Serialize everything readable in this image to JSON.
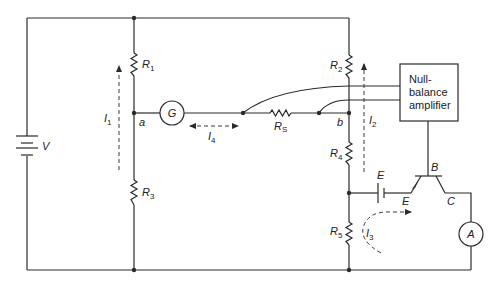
{
  "diagram": {
    "type": "circuit",
    "components": {
      "battery": {
        "label": "V"
      },
      "r1": {
        "label": "R",
        "sub": "1"
      },
      "r2": {
        "label": "R",
        "sub": "2"
      },
      "r3": {
        "label": "R",
        "sub": "3"
      },
      "r4": {
        "label": "R",
        "sub": "4"
      },
      "r5": {
        "label": "R",
        "sub": "5"
      },
      "rs": {
        "label": "R",
        "sub": "S"
      },
      "galvanometer": {
        "label": "G"
      },
      "ammeter": {
        "label": "A"
      },
      "amplifier": {
        "line1": "Null-",
        "line2": "balance",
        "line3": "amplifier"
      },
      "source_e": {
        "label": "E"
      },
      "transistor": {
        "base": "B",
        "emitter": "E",
        "collector": "C"
      }
    },
    "nodes": {
      "a": "a",
      "b": "b"
    },
    "currents": {
      "i1": {
        "label": "I",
        "sub": "1"
      },
      "i2": {
        "label": "I",
        "sub": "2"
      },
      "i3": {
        "label": "I",
        "sub": "3"
      },
      "i4": {
        "label": "I",
        "sub": "4"
      }
    },
    "colors": {
      "line": "#2a2a2a",
      "background": "#ffffff"
    }
  }
}
